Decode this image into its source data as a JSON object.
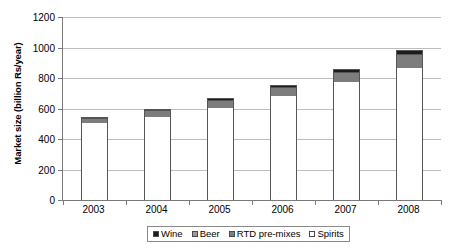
{
  "chart_data": {
    "type": "bar",
    "subtype": "stacked-column",
    "title": "",
    "xlabel": "",
    "ylabel": "Market size (billion Rs/year)",
    "categories": [
      "2003",
      "2004",
      "2005",
      "2006",
      "2007",
      "2008"
    ],
    "ylim": [
      0,
      1200
    ],
    "yticks": [
      0,
      200,
      400,
      600,
      800,
      1000,
      1200
    ],
    "ytick_labels": [
      "0",
      "200",
      "400",
      "600",
      "800",
      "1000",
      "1200"
    ],
    "grid": true,
    "legend_position": "bottom",
    "series": [
      {
        "name": "Spirits",
        "color": "#ffffff",
        "values": [
          510,
          550,
          608,
          685,
          778,
          870
        ]
      },
      {
        "name": "RTD pre-mixes",
        "color": "#7d7d7d",
        "values": [
          0,
          0,
          0,
          0,
          0,
          0
        ]
      },
      {
        "name": "Beer",
        "color": "#7d7d7d",
        "values": [
          32,
          45,
          52,
          60,
          70,
          92
        ]
      },
      {
        "name": "Wine",
        "color": "#1c1c1c",
        "values": [
          3,
          5,
          8,
          10,
          14,
          20
        ]
      }
    ],
    "totals": [
      545,
      600,
      668,
      755,
      862,
      982
    ]
  },
  "legend": {
    "items": [
      {
        "label": "Wine",
        "swatch": "wine-swatch"
      },
      {
        "label": "Beer",
        "swatch": "beer-swatch"
      },
      {
        "label": "RTD pre-mixes",
        "swatch": "rtd-pre-mixes-swatch"
      },
      {
        "label": "Spirits",
        "swatch": "spirits-swatch"
      }
    ]
  }
}
